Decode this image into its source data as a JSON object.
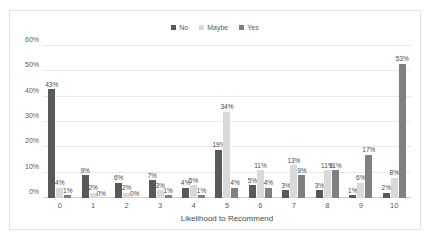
{
  "chart_data": {
    "type": "bar",
    "title": "",
    "subtitle": "",
    "xlabel": "Likelihood to Recommend",
    "ylabel": "",
    "categories": [
      "0",
      "1",
      "2",
      "3",
      "4",
      "5",
      "6",
      "7",
      "8",
      "9",
      "10"
    ],
    "series": [
      {
        "name": "No",
        "color": "#595959",
        "values": [
          43,
          9,
          6,
          7,
          4,
          19,
          5,
          3,
          3,
          1,
          2
        ],
        "labels": [
          "43%",
          "9%",
          "6%",
          "7%",
          "4%",
          "19%",
          "5%",
          "3%",
          "3%",
          "1%",
          "2%"
        ]
      },
      {
        "name": "Maybe",
        "color": "#d9d9d9",
        "values": [
          4,
          2,
          2,
          3,
          5,
          34,
          11,
          13,
          11,
          6,
          8
        ],
        "labels": [
          "4%",
          "2%",
          "2%",
          "3%",
          "5%",
          "34%",
          "11%",
          "13%",
          "11%",
          "6%",
          "8%"
        ]
      },
      {
        "name": "Yes",
        "color": "#808080",
        "values": [
          1,
          0,
          0,
          1,
          1,
          4,
          4,
          9,
          11,
          17,
          53
        ],
        "labels": [
          "1%",
          "0%",
          "0%",
          "1%",
          "1%",
          "4%",
          "4%",
          "9%",
          "11%",
          "17%",
          "53%"
        ]
      }
    ],
    "ylim": [
      0,
      60
    ],
    "yticks": [
      0,
      10,
      20,
      30,
      40,
      50,
      60
    ],
    "ytick_labels": [
      "0%",
      "10%",
      "20%",
      "30%",
      "40%",
      "50%",
      "60%"
    ],
    "grid": true,
    "legend_position": "top",
    "value_labels": true
  },
  "legend": {
    "items": [
      {
        "label": "No",
        "color": "#595959"
      },
      {
        "label": "Maybe",
        "color": "#d9d9d9"
      },
      {
        "label": "Yes",
        "color": "#808080"
      }
    ]
  }
}
